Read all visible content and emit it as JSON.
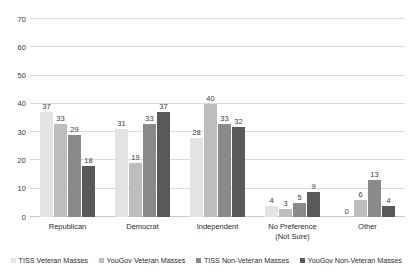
{
  "chart_data": {
    "type": "bar",
    "title": "",
    "subtitle": "",
    "xlabel": "",
    "ylabel": "",
    "ylim": [
      0,
      70
    ],
    "yticks": [
      0,
      10,
      20,
      30,
      40,
      50,
      60,
      70
    ],
    "ytick_labels": [
      "0",
      "10",
      "20",
      "30",
      "40",
      "50",
      "60",
      "70"
    ],
    "grid": true,
    "legend_position": "bottom",
    "categories": [
      "Republican",
      "Democrat",
      "Independent",
      "No Preference (Not Sure)",
      "Other"
    ],
    "category_lines": [
      [
        "Republican"
      ],
      [
        "Democrat"
      ],
      [
        "Independent"
      ],
      [
        "No Preference",
        "(Not Sure)"
      ],
      [
        "Other"
      ]
    ],
    "series": [
      {
        "name": "TISS Veteran Masses",
        "color": "#e3e3e3",
        "values": [
          37,
          31,
          28,
          4,
          0
        ],
        "labels": [
          "37",
          "31",
          "28",
          "4",
          "0"
        ]
      },
      {
        "name": "YouGov Veteran Masses",
        "color": "#bdbdbd",
        "values": [
          33,
          19,
          40,
          3,
          6
        ],
        "labels": [
          "33",
          "19",
          "40",
          "3",
          "6"
        ]
      },
      {
        "name": "TISS Non-Veteran Masses",
        "color": "#8a8a8a",
        "values": [
          29,
          33,
          33,
          5,
          13
        ],
        "labels": [
          "29",
          "33",
          "33",
          "5",
          "13"
        ]
      },
      {
        "name": "YouGov Non-Veteran Masses",
        "color": "#595959",
        "values": [
          18,
          37,
          32,
          9,
          4
        ],
        "labels": [
          "18",
          "37",
          "32",
          "9",
          "4"
        ]
      }
    ]
  },
  "style": {
    "background": "#ffffff",
    "gridline_color": "#dcdcdc",
    "axis_color": "#c9c9c9",
    "text_color": "#2b2b2b"
  }
}
